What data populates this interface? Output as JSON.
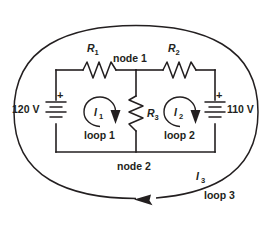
{
  "diagram": {
    "colors": {
      "ink": "#231f20",
      "background": "#ffffff"
    },
    "sources": [
      {
        "id": "left-battery",
        "label": "120 V",
        "polarity": "+",
        "position": "left-branch"
      },
      {
        "id": "right-battery",
        "label": "110 V",
        "polarity": "+",
        "position": "right-branch"
      }
    ],
    "resistors": [
      {
        "id": "r1",
        "label": "R",
        "subscript": "1",
        "orientation": "horizontal",
        "position": "top-left"
      },
      {
        "id": "r2",
        "label": "R",
        "subscript": "2",
        "orientation": "horizontal",
        "position": "top-right"
      },
      {
        "id": "r3",
        "label": "R",
        "subscript": "3",
        "orientation": "vertical",
        "position": "middle"
      }
    ],
    "nodes": [
      {
        "id": "node-1",
        "label": "node 1"
      },
      {
        "id": "node-2",
        "label": "node 2"
      }
    ],
    "loops": [
      {
        "id": "loop-1",
        "label": "loop 1",
        "current_label": "I",
        "current_subscript": "1",
        "direction": "clockwise"
      },
      {
        "id": "loop-2",
        "label": "loop 2",
        "current_label": "I",
        "current_subscript": "2",
        "direction": "clockwise"
      },
      {
        "id": "loop-3",
        "label": "loop 3",
        "current_label": "I",
        "current_subscript": "3",
        "direction": "clockwise"
      }
    ]
  }
}
